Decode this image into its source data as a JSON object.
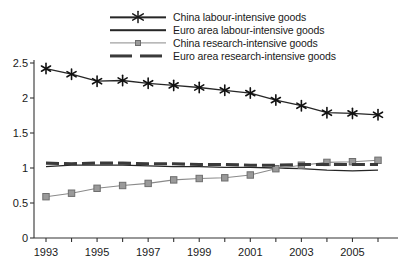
{
  "chart_data": {
    "type": "line",
    "title": "",
    "subtitle": "",
    "xlabel": "",
    "ylabel": "",
    "xlim": [
      1993,
      2006
    ],
    "ylim": [
      0,
      2.5
    ],
    "grid": false,
    "legend_position": "top-center",
    "x": [
      1993,
      1994,
      1995,
      1996,
      1997,
      1998,
      1999,
      2000,
      2001,
      2002,
      2003,
      2004,
      2005,
      2006
    ],
    "x_tick_labels": [
      "1993",
      "1995",
      "1997",
      "1999",
      "2001",
      "2003",
      "2005"
    ],
    "x_tick_values": [
      1993,
      1995,
      1997,
      1999,
      2001,
      2003,
      2005
    ],
    "y_tick_labels": [
      "0",
      "0.5",
      "1",
      "1.5",
      "2",
      "2.5"
    ],
    "y_tick_values": [
      0,
      0.5,
      1,
      1.5,
      2,
      2.5
    ],
    "series": [
      {
        "name": "China labour-intensive goods",
        "marker": "star",
        "style": "solid",
        "color": "#262626",
        "values": [
          2.42,
          2.34,
          2.24,
          2.25,
          2.21,
          2.18,
          2.15,
          2.11,
          2.07,
          1.97,
          1.89,
          1.79,
          1.78,
          1.76
        ]
      },
      {
        "name": "Euro area labour-intensive goods",
        "marker": "none",
        "style": "solid",
        "color": "#262626",
        "values": [
          1.02,
          1.04,
          1.04,
          1.04,
          1.03,
          1.02,
          1.02,
          1.01,
          1.01,
          1.0,
          0.99,
          0.97,
          0.96,
          0.97
        ]
      },
      {
        "name": "China research-intensive goods",
        "marker": "square",
        "style": "solid",
        "color": "#8a8a8a",
        "values": [
          0.59,
          0.64,
          0.71,
          0.75,
          0.78,
          0.83,
          0.85,
          0.86,
          0.9,
          0.99,
          1.04,
          1.08,
          1.09,
          1.11
        ]
      },
      {
        "name": "Euro area research-intensive goods",
        "marker": "none",
        "style": "dashed",
        "color": "#3a3a3a",
        "values": [
          1.07,
          1.06,
          1.07,
          1.07,
          1.06,
          1.06,
          1.05,
          1.05,
          1.04,
          1.04,
          1.05,
          1.05,
          1.05,
          1.05
        ]
      }
    ]
  },
  "legend": {
    "items": [
      {
        "label": "China labour-intensive goods"
      },
      {
        "label": "Euro area labour-intensive goods"
      },
      {
        "label": "China research-intensive goods"
      },
      {
        "label": "Euro area research-intensive goods"
      }
    ]
  }
}
